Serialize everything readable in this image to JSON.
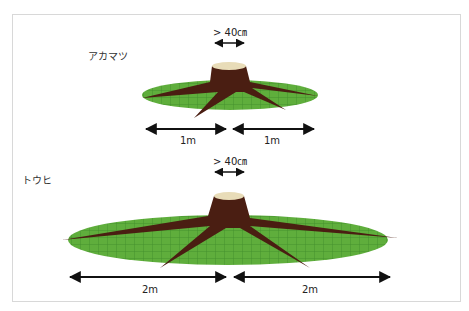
{
  "figure": {
    "sections": [
      {
        "species": "アカマツ",
        "trunk_label": "> 40㎝",
        "left_radius": "1m",
        "right_radius": "1m"
      },
      {
        "species": "トウヒ",
        "trunk_label": "> 40㎝",
        "left_radius": "2m",
        "right_radius": "2m"
      }
    ],
    "colors": {
      "grass": "#5aa83a",
      "grid": "#3f8a2a",
      "stump": "#4a1e12",
      "stump_top": "#e8dcb8",
      "arrow": "#111111"
    }
  }
}
